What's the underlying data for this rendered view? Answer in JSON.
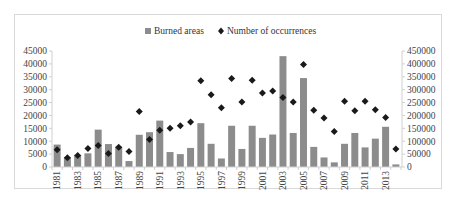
{
  "chart_data": {
    "type": "bar+scatter",
    "title": "",
    "legend": [
      {
        "label": "Burned areas",
        "marker": "square",
        "color": "#8c8c8c",
        "axis": "left"
      },
      {
        "label": "Number of occurrences",
        "marker": "diamond",
        "color": "#1a1a1a",
        "axis": "right"
      }
    ],
    "legend_position": "top",
    "categories": [
      1981,
      1982,
      1983,
      1984,
      1985,
      1986,
      1987,
      1988,
      1989,
      1990,
      1991,
      1992,
      1993,
      1994,
      1995,
      1996,
      1997,
      1998,
      1999,
      2000,
      2001,
      2002,
      2003,
      2004,
      2005,
      2006,
      2007,
      2008,
      2009,
      2010,
      2011,
      2012,
      2013,
      2014
    ],
    "x_tick_labels": [
      "1981",
      "1983",
      "1985",
      "1987",
      "1989",
      "1991",
      "1993",
      "1995",
      "1997",
      "1999",
      "2001",
      "2003",
      "2005",
      "2007",
      "2009",
      "2011",
      "2013"
    ],
    "series": [
      {
        "name": "Burned areas",
        "type": "bar",
        "axis": "left",
        "values": [
          8700,
          3800,
          4700,
          5300,
          14500,
          8900,
          7900,
          2300,
          12500,
          13500,
          18000,
          5800,
          5000,
          7400,
          17000,
          9000,
          3300,
          16000,
          7000,
          16000,
          11300,
          12600,
          43000,
          13200,
          34500,
          7800,
          3700,
          1800,
          9000,
          13200,
          7600,
          11000,
          15600,
          1000
        ]
      },
      {
        "name": "Number of occurrences",
        "type": "scatter",
        "axis": "right",
        "values": [
          67000,
          36000,
          45000,
          72000,
          83000,
          52000,
          77000,
          60000,
          215000,
          107000,
          143000,
          150000,
          160000,
          175000,
          335000,
          280000,
          230000,
          343000,
          252000,
          337000,
          287000,
          295000,
          270000,
          252000,
          398000,
          220000,
          190000,
          138000,
          255000,
          218000,
          255000,
          222000,
          192000,
          70000
        ]
      }
    ],
    "left_axis": {
      "ylim": [
        0,
        45000
      ],
      "ticks": [
        "0",
        "5000",
        "10000",
        "15000",
        "20000",
        "25000",
        "30000",
        "35000",
        "40000",
        "45000"
      ]
    },
    "right_axis": {
      "ylim": [
        0,
        450000
      ],
      "ticks": [
        "0",
        "50000",
        "100000",
        "150000",
        "200000",
        "250000",
        "300000",
        "350000",
        "400000",
        "450000"
      ]
    },
    "xlabel": "",
    "ylabel": "",
    "grid": false
  }
}
